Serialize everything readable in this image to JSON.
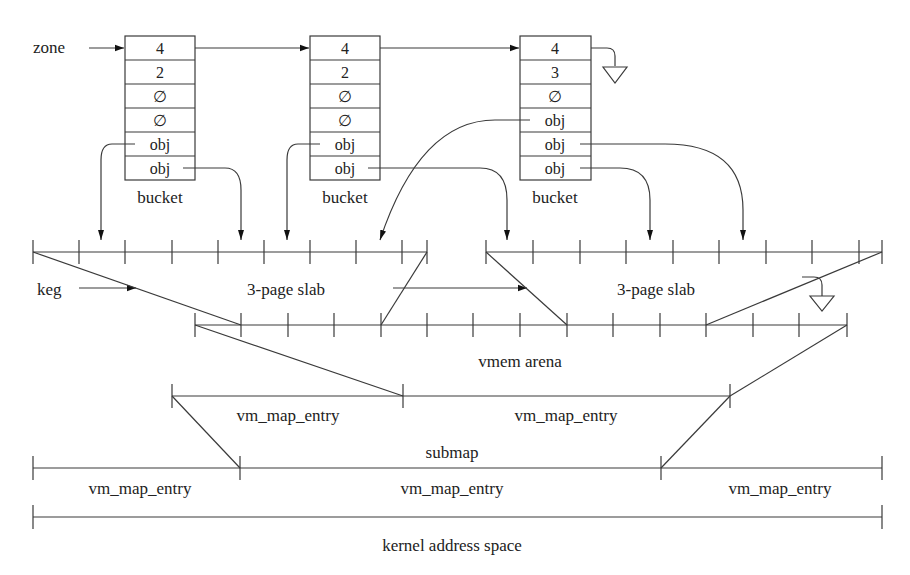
{
  "diagram": {
    "type": "memory-allocator-layering",
    "labels": {
      "zone": "zone",
      "keg": "keg",
      "bucket": "bucket",
      "slab_left": "3-page slab",
      "slab_right": "3-page slab",
      "vmem_arena": "vmem arena",
      "submap": "submap",
      "submap_entry_left": "vm_map_entry",
      "submap_entry_right": "vm_map_entry",
      "kernel_entry_left": "vm_map_entry",
      "kernel_entry_middle": "vm_map_entry",
      "kernel_entry_right": "vm_map_entry",
      "kernel_address_space": "kernel address space"
    },
    "buckets": [
      {
        "label": "bucket",
        "cells": [
          "4",
          "2",
          "∅",
          "∅",
          "obj",
          "obj"
        ]
      },
      {
        "label": "bucket",
        "cells": [
          "4",
          "2",
          "∅",
          "∅",
          "obj",
          "obj"
        ]
      },
      {
        "label": "bucket",
        "cells": [
          "4",
          "3",
          "∅",
          "obj",
          "obj",
          "obj"
        ]
      }
    ],
    "colors": {
      "line": "#3a3a3a",
      "text": "#222222",
      "background": "#ffffff"
    }
  }
}
